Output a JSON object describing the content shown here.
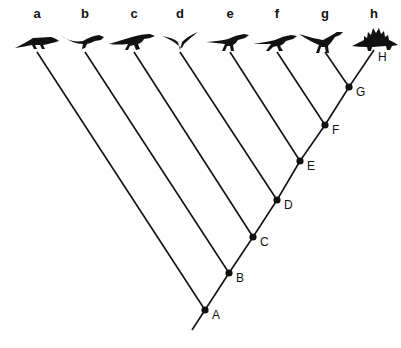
{
  "diagram": {
    "type": "cladogram",
    "line_color": "#111111",
    "background": "#ffffff",
    "tips": [
      {
        "label": "a",
        "animal": "crawling-reptile-silhouette",
        "x": 37,
        "label_y": 6
      },
      {
        "label": "b",
        "animal": "long-tailed-reptile-silhouette",
        "x": 85,
        "label_y": 6
      },
      {
        "label": "c",
        "animal": "archosaur-running-silhouette",
        "x": 134,
        "label_y": 6
      },
      {
        "label": "d",
        "animal": "pterosaur-silhouette",
        "x": 180,
        "label_y": 6
      },
      {
        "label": "e",
        "animal": "small-dinosaur-silhouette",
        "x": 230,
        "label_y": 6
      },
      {
        "label": "f",
        "animal": "theropod-silhouette",
        "x": 277,
        "label_y": 6
      },
      {
        "label": "g",
        "animal": "bipedal-dinosaur-silhouette",
        "x": 325,
        "label_y": 6
      },
      {
        "label": "h",
        "animal": "stegosaur-silhouette",
        "x": 374,
        "label_y": 6
      }
    ],
    "nodes": [
      {
        "label": "A",
        "x": 205,
        "y": 310
      },
      {
        "label": "B",
        "x": 229,
        "y": 273
      },
      {
        "label": "C",
        "x": 253,
        "y": 237
      },
      {
        "label": "D",
        "x": 277,
        "y": 200
      },
      {
        "label": "E",
        "x": 300,
        "y": 161
      },
      {
        "label": "F",
        "x": 325,
        "y": 125
      },
      {
        "label": "G",
        "x": 349,
        "y": 87
      }
    ],
    "terminal_label": {
      "label": "H",
      "x": 378,
      "y": 50
    },
    "root": {
      "x": 192,
      "y": 330
    }
  }
}
